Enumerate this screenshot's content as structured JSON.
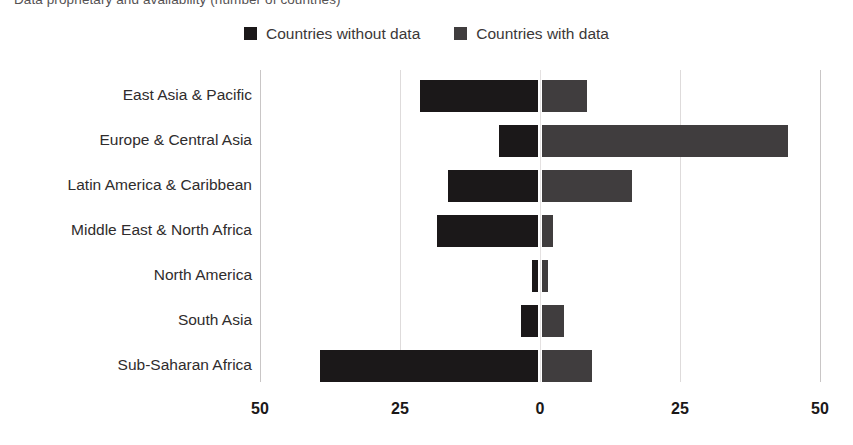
{
  "title": "Data proprietary and availability (number of countries)",
  "legend": {
    "position": "top-center",
    "items": [
      {
        "label": "Countries without data",
        "color": "#1b1819",
        "icon": "legend-swatch-square"
      },
      {
        "label": "Countries with data",
        "color": "#403d3e",
        "icon": "legend-swatch-square"
      }
    ]
  },
  "axis": {
    "x_ticks": [
      {
        "label": "50",
        "value": -50
      },
      {
        "label": "25",
        "value": -25
      },
      {
        "label": "0",
        "value": 0
      },
      {
        "label": "25",
        "value": 25
      },
      {
        "label": "50",
        "value": 50
      }
    ],
    "xlim": [
      -50,
      50
    ],
    "pixels_per_unit": 5.6,
    "zero_px": 540,
    "grid": "vertical"
  },
  "chart_data": {
    "type": "bar",
    "orientation": "horizontal",
    "layout": "diverging",
    "title": "Data proprietary and availability (number of countries)",
    "xlabel": "",
    "ylabel": "",
    "xlim": [
      -50,
      50
    ],
    "xticks": [
      -50,
      -25,
      0,
      25,
      50
    ],
    "xticklabels": [
      "50",
      "25",
      "0",
      "25",
      "50"
    ],
    "grid": true,
    "legend_position": "top-center",
    "categories": [
      "East Asia & Pacific",
      "Europe & Central Asia",
      "Latin America & Caribbean",
      "Middle East & North Africa",
      "North America",
      "South Asia",
      "Sub-Saharan Africa"
    ],
    "series": [
      {
        "name": "Countries without data",
        "color": "#1b1819",
        "direction": "left",
        "values": [
          21,
          7,
          16,
          18,
          1,
          3,
          39
        ]
      },
      {
        "name": "Countries with data",
        "color": "#403d3e",
        "direction": "right",
        "values": [
          8,
          44,
          16,
          2,
          1,
          4,
          9
        ]
      }
    ]
  }
}
